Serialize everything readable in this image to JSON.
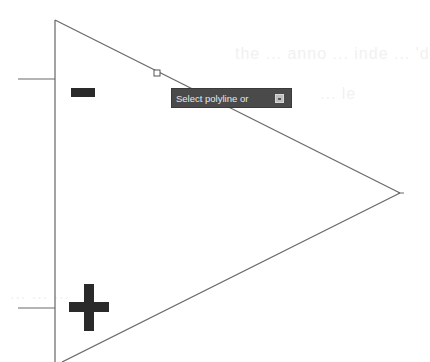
{
  "drawing": {
    "symbol": "op-amp-triangle",
    "inverting_input_sign": "−",
    "non_inverting_input_sign": "+",
    "line_color": "#707070",
    "sign_color": "#2a2a2a"
  },
  "tooltip": {
    "prompt": "Select polyline or",
    "menu_icon": "dropdown-arrow-icon",
    "background": "#4a4a4a"
  },
  "background_ghost_text": {
    "line1": "the ... anno ... inde ... 'd",
    "line2": "... le",
    "line3": "... ... ..."
  }
}
